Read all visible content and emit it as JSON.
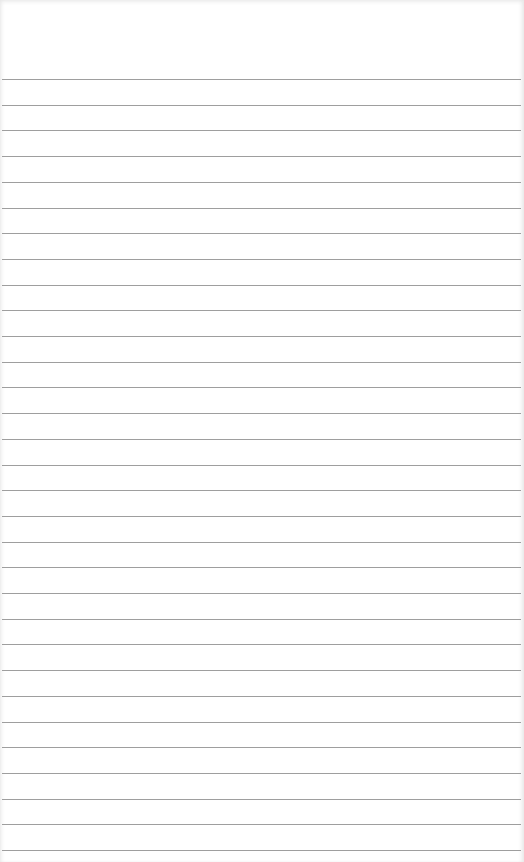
{
  "page": {
    "type": "ruled-paper",
    "background_color": "#ffffff",
    "line_color": "#9e9e9e",
    "first_line_y": 79,
    "line_spacing": 25.7,
    "line_count": 31
  }
}
